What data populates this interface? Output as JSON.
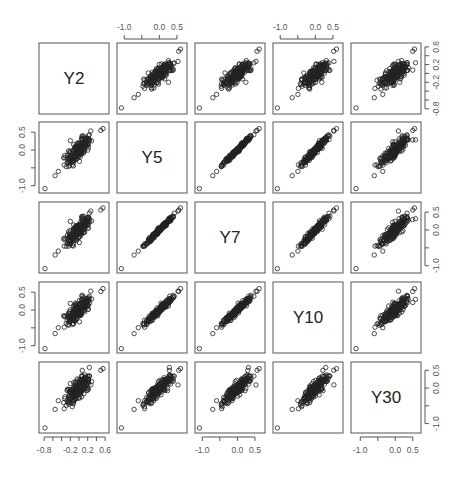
{
  "chart_data": {
    "type": "scatter",
    "subtype": "pairs-matrix",
    "title": "",
    "variables": [
      "Y2",
      "Y5",
      "Y7",
      "Y10",
      "Y30"
    ],
    "axes": {
      "Y2": {
        "range": [
          -0.85,
          0.62
        ],
        "ticks": [
          -0.8,
          -0.6,
          -0.4,
          -0.2,
          0.0,
          0.2,
          0.4,
          0.6
        ],
        "tick_labels": [
          "-0.8",
          "",
          "",
          "-0.2",
          "0.0",
          "0.2",
          "0.4",
          "0.6"
        ],
        "bottom_labels": [
          "-0.8",
          "-0.2",
          "0.2",
          "0.6"
        ],
        "right_labels": [
          "-0.8",
          "-0.2",
          "0.2",
          "0.6"
        ]
      },
      "Y5": {
        "range": [
          -1.12,
          0.7
        ],
        "ticks": [
          -1.0,
          -0.5,
          0.0,
          0.5
        ],
        "tick_labels": [
          "-1.0",
          "",
          "0.0",
          "0.5"
        ]
      },
      "Y7": {
        "range": [
          -1.12,
          0.7
        ],
        "ticks": [
          -1.0,
          -0.5,
          0.0,
          0.5
        ],
        "tick_labels": [
          "-1.0",
          "",
          "0.0",
          "0.5"
        ]
      },
      "Y10": {
        "range": [
          -1.12,
          0.7
        ],
        "ticks": [
          -1.0,
          -0.5,
          0.0,
          0.5
        ],
        "tick_labels": [
          "-1.0",
          "",
          "0.0",
          "0.5"
        ]
      },
      "Y30": {
        "range": [
          -1.18,
          0.65
        ],
        "ticks": [
          -1.0,
          -0.5,
          0.0,
          0.5
        ],
        "tick_labels": [
          "-1.0",
          "",
          "0.0",
          "0.5"
        ]
      }
    },
    "axis_placement": {
      "top": [
        "Y5",
        "Y10"
      ],
      "bottom": [
        "Y2",
        "Y7",
        "Y30"
      ],
      "left": [
        "Y5",
        "Y10"
      ],
      "right": [
        "Y2",
        "Y7",
        "Y30"
      ]
    },
    "correlations": {
      "Y2-Y5": 0.82,
      "Y2-Y7": 0.78,
      "Y2-Y10": 0.72,
      "Y2-Y30": 0.55,
      "Y5-Y7": 0.99,
      "Y5-Y10": 0.95,
      "Y5-Y30": 0.85,
      "Y7-Y10": 0.98,
      "Y7-Y30": 0.88,
      "Y10-Y30": 0.93
    },
    "n_points": 180,
    "marker": "open-circle",
    "grid": false,
    "legend": null
  },
  "colors": {
    "frame": "#555555",
    "points": "#222222",
    "text": "#222222",
    "tick_text": "#555555",
    "background": "#ffffff"
  },
  "layout": {
    "panel_x": [
      39,
      117,
      195,
      273,
      351
    ],
    "panel_y": [
      43,
      122,
      202,
      282,
      362
    ],
    "panel_w": 70,
    "panel_h": 71
  }
}
